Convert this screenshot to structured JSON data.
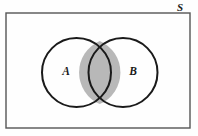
{
  "figure": {
    "type": "venn-diagram",
    "canvas": {
      "width": 198,
      "height": 136,
      "background": "#fefefe"
    },
    "universe": {
      "label": "S",
      "label_x": 180,
      "label_y": 8,
      "rect": {
        "x": 6,
        "y": 13,
        "width": 184,
        "height": 115
      },
      "stroke": "#555555",
      "stroke_width": 1.4,
      "fill": "#fefefe"
    },
    "sets": [
      {
        "label": "A",
        "cx": 76.5,
        "cy": 72.5,
        "r": 34.5,
        "label_x": 66,
        "label_y": 72.5,
        "stroke": "#1a1a1a",
        "stroke_width": 2,
        "fill": "#ffffff"
      },
      {
        "label": "B",
        "cx": 123,
        "cy": 72.5,
        "r": 34.5,
        "label_x": 133,
        "label_y": 72.5,
        "stroke": "#1a1a1a",
        "stroke_width": 2,
        "fill": "#ffffff"
      }
    ],
    "intersection": {
      "name": "A-intersect-B",
      "shaded": true,
      "fill": "#b8b8b8",
      "top_point_x": 99.75,
      "top_point_y": 40.9,
      "bottom_point_x": 99.75,
      "bottom_point_y": 104.1,
      "left_extent_x": 88.5,
      "right_extent_x": 111
    }
  },
  "chart_data": {
    "type": "diagram",
    "subtype": "venn",
    "universal_set": "S",
    "regions": [
      {
        "name": "A only",
        "label": "A",
        "shaded": false
      },
      {
        "name": "B only",
        "label": "B",
        "shaded": false
      },
      {
        "name": "A and B",
        "label": "",
        "shaded": true
      },
      {
        "name": "outside A and B",
        "label": "S",
        "shaded": false
      }
    ],
    "legend": [],
    "annotations": [
      "S",
      "A",
      "B"
    ]
  }
}
